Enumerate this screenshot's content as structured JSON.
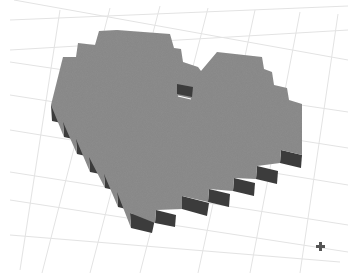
{
  "scene": {
    "object_name": "pixel heart",
    "colors": {
      "background": "#ffffff",
      "grid_line": "#e3e3e3",
      "top_face": "#8c8c8c",
      "side_face": "#3c3c3c",
      "cursor": "#555555"
    },
    "cursor_icon": "crosshair-icon"
  }
}
